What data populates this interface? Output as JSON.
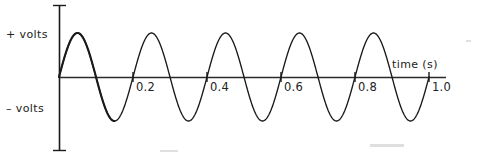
{
  "figure": {
    "background_color": "#ffffff",
    "ink_color": "#1a1a1a"
  },
  "labels": {
    "y_positive": "+ volts",
    "y_negative": "– volts",
    "x_axis": "time (s)"
  },
  "chart_data": {
    "type": "line",
    "title": "",
    "subtitle": "",
    "xlabel": "time (s)",
    "ylabel": "",
    "y_axis_positive_label": "+ volts",
    "y_axis_negative_label": "– volts",
    "grid": false,
    "legend": false,
    "legend_position": "none",
    "xlim": [
      0.0,
      1.08
    ],
    "ylim": [
      -1.0,
      1.0
    ],
    "xticks": [
      0.2,
      0.4,
      0.6,
      0.8,
      1.0
    ],
    "xtick_labels": [
      "0.2",
      "0.4",
      "0.6",
      "0.8",
      "1.0"
    ],
    "yticks": [],
    "ytick_labels": [],
    "series": [
      {
        "name": "voltage",
        "waveform": "sine",
        "amplitude": 1.0,
        "frequency_hz": 5,
        "period_s": 0.2,
        "phase_deg": 0,
        "cycles_shown": 5,
        "x_start": 0.0,
        "x_end": 1.0,
        "color": "#1a1a1a",
        "line_width": 1.3,
        "x": [
          0.0,
          0.05,
          0.1,
          0.15,
          0.2,
          0.25,
          0.3,
          0.35,
          0.4,
          0.45,
          0.5,
          0.55,
          0.6,
          0.65,
          0.7,
          0.75,
          0.8,
          0.85,
          0.9,
          0.95,
          1.0
        ],
        "y": [
          0,
          1,
          0,
          -1,
          0,
          1,
          0,
          -1,
          0,
          1,
          0,
          -1,
          0,
          1,
          0,
          -1,
          0,
          1,
          0,
          -1,
          0
        ]
      }
    ]
  },
  "geometry": {
    "origin_x": 59,
    "baseline_y": 77,
    "x_axis_end": 446,
    "y_axis_top": 5,
    "y_axis_bottom": 151,
    "px_per_second": 370,
    "amplitude_px": 44,
    "tick_half_height": 5
  }
}
